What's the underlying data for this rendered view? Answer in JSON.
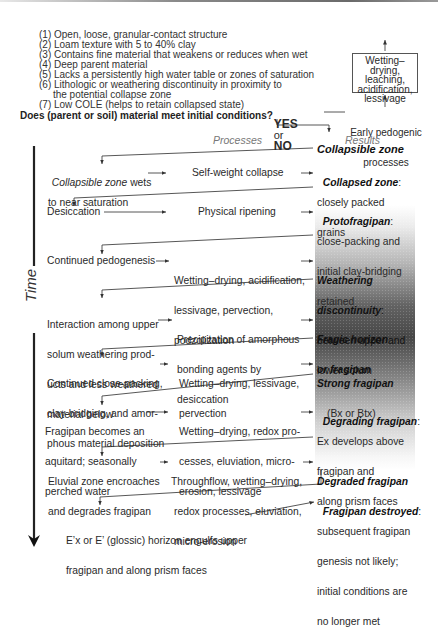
{
  "conditions": [
    "(1) Open, loose, granular-contact structure",
    "(2) Loam texture with 5 to 40% clay",
    "(3) Contains fine material that weakens or reduces when wet",
    "(4) Deep parent material",
    "(5) Lacks a persistently high water table or zones of saturation",
    "(6) Lithologic or weathering discontinuity in proximity to",
    "     the potential collapse zone",
    "(7) Low COLE (helps to retain collapsed state)"
  ],
  "question": "Does (parent or soil) material meet initial conditions?",
  "yes_label": "YES",
  "or_label": "or",
  "no_label": "NO",
  "early": {
    "box_lines": [
      "Wetting–drying,",
      "leaching,",
      "acidification,",
      "lessivage"
    ],
    "label_lines": [
      "Early pedogenic",
      "processes"
    ]
  },
  "headers": {
    "processes": "Processes",
    "results": "Results"
  },
  "time_label": "Time",
  "start_result": "Collapsible zone",
  "stages": [
    {
      "condition": [
        "",
        "to near saturation"
      ],
      "condition_italic_prefix": "Collapsible zone",
      "condition_rest": " wets",
      "process": [
        "Self-weight collapse"
      ],
      "result_title": "Collapsed zone",
      "result_lines": [
        "closely packed",
        "grains"
      ]
    },
    {
      "condition": [
        "Desiccation"
      ],
      "process": [
        "Physical ripening"
      ],
      "result_title": "Protofragipan",
      "result_lines": [
        "close-packing and",
        "initial clay-bridging",
        "retained"
      ]
    },
    {
      "condition": [
        "Continued pedogenesis"
      ],
      "process": [
        "Wetting–drying, acidification,",
        "lessivage, pervection,",
        "podzolization"
      ],
      "result_title": "Weathering",
      "result_title2": "discontinuity",
      "result_lines": [
        "between upper and",
        "lower solum"
      ]
    },
    {
      "condition": [
        "Interaction among upper",
        "solum weathering prod-",
        "ucts and less weathered",
        "material below"
      ],
      "process": [
        "Precipitation of amorphous",
        "bonding agents by",
        "desiccation"
      ],
      "result_title": "Fragic horizon",
      "result_title2": "or fragipan",
      "result_lines": []
    },
    {
      "condition": [
        "Continued close-packing,",
        "clay-bridging, and amor-",
        "phous material deposition"
      ],
      "process": [
        "Wetting–drying, lessivage,",
        "pervection"
      ],
      "result_title": "Strong fragipan",
      "result_lines": [
        "(Bx or Btx)"
      ]
    },
    {
      "condition": [
        "Fragipan becomes an",
        "aquitard; seasonally",
        "perched water"
      ],
      "process": [
        "Wetting–drying, redox pro-",
        "cesses, eluviation, micro-",
        "erosion, lessivage"
      ],
      "result_title": "Degrading fragipan",
      "result_lines": [
        "Ex develops above",
        "fragipan and",
        "along prism faces"
      ]
    },
    {
      "condition": [
        "Eluvial zone encroaches",
        "and degrades fragipan"
      ],
      "process": [
        "Throughflow, wetting–drying,",
        "redox processes, eluviation,",
        "micro-erosion"
      ],
      "result_title": "Degraded fragipan",
      "result_lines": []
    },
    {
      "condition": [
        "E’x or E’ (glossic) horizon engulfs upper",
        "fragipan and along prism faces"
      ],
      "process": [],
      "result_title": "Fragipan destroyed",
      "result_lines": [
        "subsequent fragipan",
        "genesis not likely;",
        "initial conditions are",
        "no longer met"
      ]
    }
  ]
}
